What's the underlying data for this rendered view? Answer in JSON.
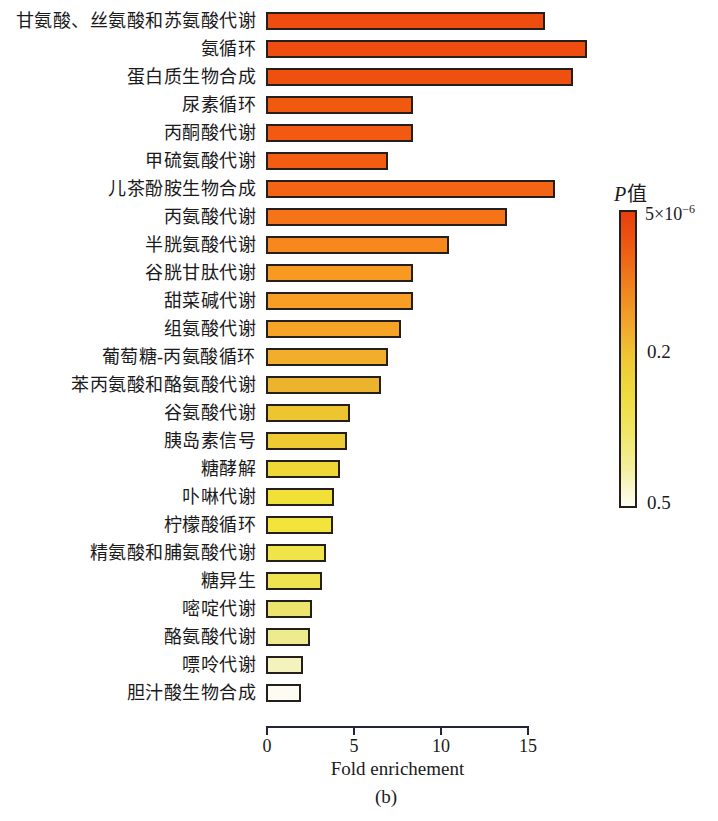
{
  "chart_data": {
    "type": "bar",
    "orientation": "horizontal",
    "title": "",
    "xlabel": "Fold enrichement",
    "caption": "(b)",
    "xlim": [
      0,
      15
    ],
    "x_ticks": [
      "0",
      "5",
      "10",
      "15"
    ],
    "x_tick_values": [
      0,
      5,
      10,
      15
    ],
    "grid": false,
    "categories": [
      "甘氨酸、丝氨酸和苏氨酸代谢",
      "氨循环",
      "蛋白质生物合成",
      "尿素循环",
      "丙酮酸代谢",
      "甲硫氨酸代谢",
      "儿茶酚胺生物合成",
      "丙氨酸代谢",
      "半胱氨酸代谢",
      "谷胱甘肽代谢",
      "甜菜碱代谢",
      "组氨酸代谢",
      "葡萄糖-丙氨酸循环",
      "苯丙氨酸和酪氨酸代谢",
      "谷氨酸代谢",
      "胰岛素信号",
      "糖酵解",
      "卟啉代谢",
      "柠檬酸循环",
      "精氨酸和脯氨酸代谢",
      "糖异生",
      "嘧啶代谢",
      "酪氨酸代谢",
      "嘌呤代谢",
      "胆汁酸生物合成"
    ],
    "values": [
      15.8,
      18.2,
      17.4,
      8.2,
      8.2,
      6.8,
      16.4,
      13.6,
      10.3,
      8.2,
      8.2,
      7.5,
      6.8,
      6.4,
      4.6,
      4.4,
      4.0,
      3.7,
      3.6,
      3.2,
      3.0,
      2.4,
      2.3,
      1.9,
      1.8
    ],
    "bar_colors": [
      "#ee4d0f",
      "#ee4d0f",
      "#ef4f0f",
      "#f15810",
      "#f25a11",
      "#f25d12",
      "#f36515",
      "#f57418",
      "#f6881d",
      "#f89a22",
      "#f89e24",
      "#f6a426",
      "#f0ae2a",
      "#ecb42c",
      "#edc530",
      "#eecb32",
      "#efd735",
      "#f1e038",
      "#f2e43b",
      "#efe448",
      "#eee450",
      "#ebe56d",
      "#edeb8e",
      "#f5f3bd",
      "#fdfcf2"
    ],
    "bar_border_color": "#241f1c",
    "legend": {
      "title_italic": "P",
      "title_regular": "值",
      "position": "right",
      "top_label_base": "5×10",
      "top_label_exp": "−6",
      "mid_label": "0.2",
      "bottom_label": "0.5",
      "gradient": [
        "#e73e0c",
        "#ee5c12",
        "#f0811d",
        "#f2a42a",
        "#eec935",
        "#efdc3e",
        "#f0e766",
        "#f4f0a0",
        "#fefef2"
      ]
    }
  }
}
